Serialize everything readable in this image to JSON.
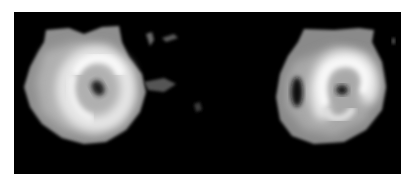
{
  "figure": {
    "background_color": "#ffffff",
    "panel_color": "#000000",
    "images": [
      {
        "name": "left-scan",
        "description": "grayscale scan blob with bright curved ring and dark center spot",
        "outer_tone": "#9a9a9a",
        "ring_tone": "#f2f2f2",
        "core_tone": "#1a1a1a"
      },
      {
        "name": "right-scan",
        "description": "grayscale scan blob with bright S-shaped ring, dark center spot and dark left cavity",
        "outer_tone": "#8e8e8e",
        "ring_tone": "#f4f4f4",
        "core_tone": "#151515"
      }
    ]
  }
}
